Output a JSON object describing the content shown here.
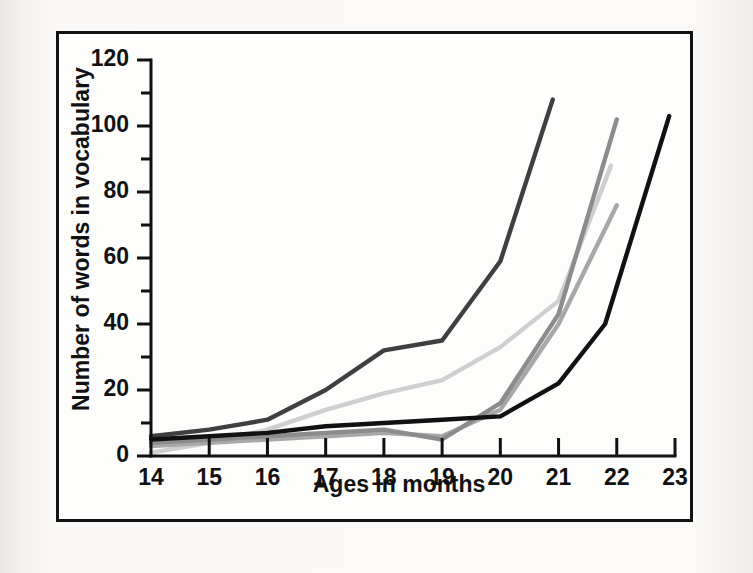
{
  "figure": {
    "background_color": "#f7f6f4",
    "frame_color": "#111111",
    "plot_background": "#fdfdfc"
  },
  "chart_data": {
    "type": "line",
    "title": "",
    "xlabel": "Ages in months",
    "ylabel": "Number of words in vocabulary",
    "xlim": [
      14,
      23
    ],
    "ylim": [
      0,
      120
    ],
    "xticks": [
      14,
      15,
      16,
      17,
      18,
      19,
      20,
      21,
      22,
      23
    ],
    "xticklabels": [
      "14",
      "15",
      "16",
      "17",
      "18",
      "19",
      "20",
      "21",
      "22",
      "23"
    ],
    "yticks": [
      0,
      20,
      40,
      60,
      80,
      100,
      120
    ],
    "yticklabels": [
      "0",
      "20",
      "40",
      "60",
      "80",
      "100",
      "120"
    ],
    "yminorticks": [
      10,
      30,
      50,
      70,
      90,
      110
    ],
    "grid": false,
    "legend": null,
    "x_tick_direction": "in",
    "y_tick_direction": "out",
    "series": [
      {
        "name": "Child 1",
        "color": "#3f3f3f",
        "x": [
          14,
          15,
          16,
          17,
          18,
          19,
          20,
          20.9
        ],
        "values": [
          6,
          8,
          11,
          20,
          32,
          35,
          59,
          108
        ]
      },
      {
        "name": "Child 2",
        "color": "#cfcfcf",
        "x": [
          14,
          15,
          16,
          17,
          18,
          19,
          20,
          21,
          21.9
        ],
        "values": [
          1,
          4,
          8,
          14,
          19,
          23,
          33,
          47,
          88
        ]
      },
      {
        "name": "Child 3",
        "color": "#8c8c8c",
        "x": [
          14,
          15,
          16,
          17,
          18,
          19,
          20,
          21,
          22.0
        ],
        "values": [
          4,
          5,
          6,
          7,
          8,
          5,
          16,
          43,
          102
        ]
      },
      {
        "name": "Child 4",
        "color": "#a8a8a8",
        "x": [
          14,
          15,
          16,
          17,
          18,
          19,
          20,
          21,
          22.0
        ],
        "values": [
          3,
          4,
          5,
          6,
          7,
          6,
          14,
          40,
          76
        ]
      },
      {
        "name": "Child 5",
        "color": "#111111",
        "x": [
          14,
          15,
          16,
          17,
          18,
          19,
          20,
          21,
          21.8,
          22.9
        ],
        "values": [
          5,
          6,
          7,
          9,
          10,
          11,
          12,
          22,
          40,
          103
        ]
      }
    ]
  },
  "axes": {
    "y_title": "Number of words in vocabulary",
    "x_title": "Ages in months"
  }
}
